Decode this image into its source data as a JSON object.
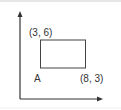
{
  "diagram": {
    "type": "coordinate-rectangle",
    "axes": {
      "x_axis": "horizontal arrow",
      "y_axis": "vertical arrow"
    },
    "rectangle": {
      "top_left_label": "(3, 6)",
      "bottom_left_label": "A",
      "bottom_right_label": "(8, 3)"
    },
    "colors": {
      "stroke": "#333333",
      "background": "#ffffff"
    }
  }
}
